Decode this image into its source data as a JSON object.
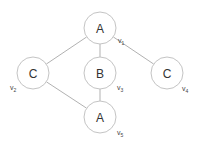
{
  "diagram": {
    "type": "graph",
    "nodes": [
      {
        "id": "v1",
        "label": "A",
        "var": "v",
        "sub": "1",
        "cx": 100,
        "cy": 28,
        "r": 16,
        "lx": 118,
        "ly": 43
      },
      {
        "id": "v2",
        "label": "C",
        "var": "v",
        "sub": "2",
        "cx": 33,
        "cy": 73,
        "r": 16,
        "lx": 10,
        "ly": 90
      },
      {
        "id": "v3",
        "label": "B",
        "var": "v",
        "sub": "3",
        "cx": 100,
        "cy": 73,
        "r": 16,
        "lx": 117,
        "ly": 90
      },
      {
        "id": "v4",
        "label": "C",
        "var": "v",
        "sub": "4",
        "cx": 167,
        "cy": 73,
        "r": 16,
        "lx": 182,
        "ly": 91
      },
      {
        "id": "v5",
        "label": "A",
        "var": "v",
        "sub": "5",
        "cx": 100,
        "cy": 117,
        "r": 16,
        "lx": 117,
        "ly": 135
      }
    ],
    "edges": [
      {
        "from": "v1",
        "to": "v2"
      },
      {
        "from": "v1",
        "to": "v3"
      },
      {
        "from": "v1",
        "to": "v4"
      },
      {
        "from": "v3",
        "to": "v5"
      },
      {
        "from": "v2",
        "to": "v5"
      }
    ],
    "colors": {
      "edge": "#a8a8a8",
      "node_stroke": "#c4c4c4",
      "node_fill": "#ffffff",
      "text": "#333333"
    }
  }
}
